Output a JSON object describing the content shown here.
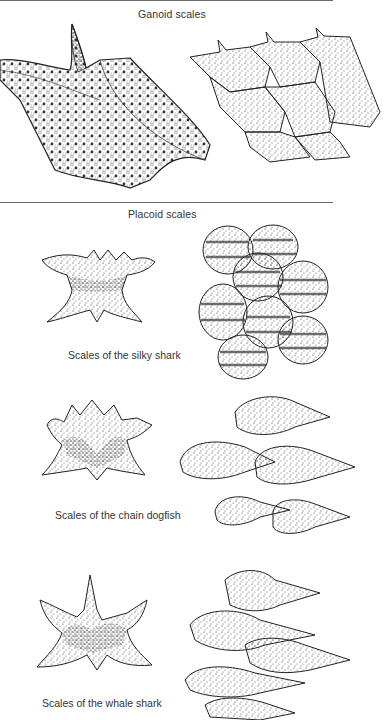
{
  "figure": {
    "sections": [
      {
        "title": "Ganoid scales",
        "illustrations": [
          "single-ganoid-scale",
          "overlapping-ganoid-scales"
        ]
      },
      {
        "title": "Placoid scales",
        "panels": [
          {
            "caption": "Scales of the silky shark"
          },
          {
            "caption": "Scales of the chain dogfish"
          },
          {
            "caption": "Scales of the whale shark"
          }
        ]
      }
    ]
  },
  "colors": {
    "ink": "#222222",
    "rule": "#6a6a6a",
    "background": "#ffffff"
  }
}
